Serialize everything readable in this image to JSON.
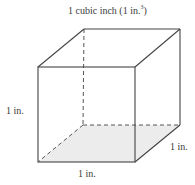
{
  "diagram": {
    "title": {
      "main": "1 cubic inch (1 in.",
      "sup": "3",
      "close": ")"
    },
    "labels": {
      "height": "1 in.",
      "depth": "1 in.",
      "width": "1 in."
    },
    "colors": {
      "edge": "#444444",
      "base_fill": "#ececec",
      "background": "#ffffff"
    },
    "vertices": {
      "front_top_left": [
        38,
        67
      ],
      "front_top_right": [
        134,
        67
      ],
      "front_bottom_left": [
        38,
        162
      ],
      "front_bottom_right": [
        135,
        162
      ],
      "back_top_left": [
        84,
        29
      ],
      "back_top_right": [
        180,
        29
      ],
      "back_bottom_left": [
        83,
        125
      ],
      "back_bottom_right": [
        180,
        125
      ]
    }
  }
}
